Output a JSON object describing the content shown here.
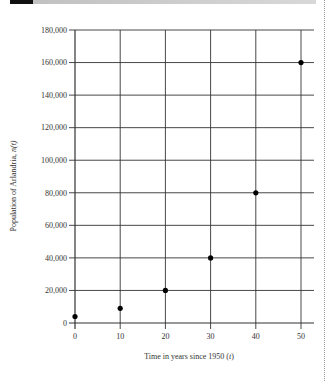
{
  "chart_data": {
    "type": "scatter",
    "title": "",
    "xlabel": "Time in years since 1950 (t)",
    "ylabel": "Population of Arlandria, n(t)",
    "x": [
      0,
      10,
      20,
      30,
      40,
      50
    ],
    "values": [
      4000,
      9000,
      20000,
      40000,
      80000,
      160000
    ],
    "series": [
      {
        "name": "n(t)",
        "x": [
          0,
          10,
          20,
          30,
          40,
          50
        ],
        "values": [
          4000,
          9000,
          20000,
          40000,
          80000,
          160000
        ]
      }
    ],
    "xlim": [
      0,
      50
    ],
    "ylim": [
      0,
      180000
    ],
    "x_ticks": [
      "0",
      "10",
      "20",
      "30",
      "40",
      "50"
    ],
    "y_ticks": [
      "0",
      "20,000",
      "40,000",
      "60,000",
      "80,000",
      "100,000",
      "120,000",
      "140,000",
      "160,000",
      "180,000"
    ],
    "grid": true,
    "legend": null,
    "colors": {
      "point": "#000000",
      "grid": "#333333"
    }
  },
  "labels": {
    "xlabel_main": "Time in years since 1950 (",
    "xlabel_var": "t",
    "xlabel_close": ")",
    "ylabel_main": "Population of Arlandria, ",
    "ylabel_var": "n",
    "ylabel_paren": "(t)"
  }
}
